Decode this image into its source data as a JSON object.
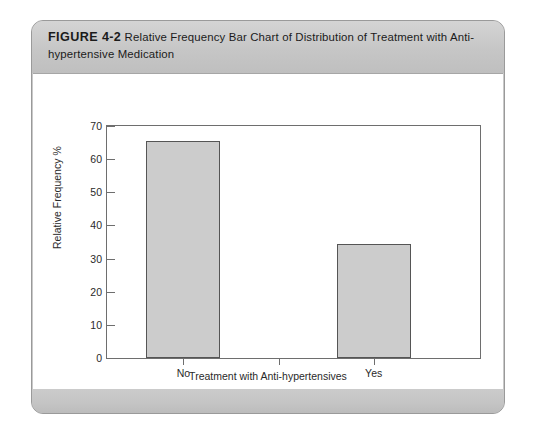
{
  "figure": {
    "number_label": "FIGURE 4-2",
    "caption": "Relative Frequency Bar Chart of Distribution of Treatment with Anti-hypertensive Medication"
  },
  "colors": {
    "panel_background": "#c9c9c9",
    "panel_border": "#9a9a9a",
    "canvas_background": "#ffffff",
    "bar_fill": "#cccccc",
    "bar_border": "#555555",
    "axis_line": "#6e6e6e",
    "text": "#2a2a2a"
  },
  "chart_data": {
    "type": "bar",
    "title": "",
    "categories": [
      "No",
      "Yes"
    ],
    "values": [
      65.5,
      34.5
    ],
    "series": [
      {
        "name": "Relative Frequency %",
        "values": [
          65.5,
          34.5
        ]
      }
    ],
    "xlabel": "Treatment with Anti-hypertensives",
    "ylabel": "Relative Frequency %",
    "ylim": [
      0,
      70
    ],
    "yticks": [
      0,
      10,
      20,
      30,
      40,
      50,
      60,
      70
    ],
    "ytick_labels": [
      "0",
      "10",
      "20",
      "30",
      "40",
      "50",
      "60",
      "70"
    ],
    "xtick_labels": [
      "No",
      "Yes"
    ],
    "grid": false,
    "legend": false,
    "legend_position": "none"
  }
}
